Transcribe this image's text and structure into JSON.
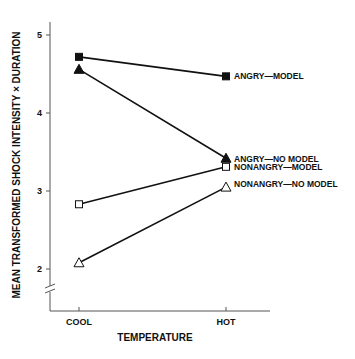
{
  "chart_data": {
    "type": "line",
    "title": "",
    "xlabel": "TEMPERATURE",
    "ylabel": "MEAN TRANSFORMED SHOCK INTENSITY × DURATION",
    "categories": [
      "COOL",
      "HOT"
    ],
    "y_ticks": [
      2,
      3,
      4,
      5
    ],
    "ylim": [
      1.5,
      5.3
    ],
    "axis_break": true,
    "grid": false,
    "legend_position": "inline-right",
    "series": [
      {
        "name": "ANGRY—MODEL",
        "marker": "filled-square",
        "values": [
          4.72,
          4.47
        ]
      },
      {
        "name": "ANGRY—NO MODEL",
        "marker": "filled-triangle",
        "values": [
          4.56,
          3.42
        ]
      },
      {
        "name": "NONANGRY—MODEL",
        "marker": "open-square",
        "values": [
          2.83,
          3.31
        ]
      },
      {
        "name": "NONANGRY—NO MODEL",
        "marker": "open-triangle",
        "values": [
          2.08,
          3.05
        ]
      }
    ]
  },
  "colors": {
    "line": "#111111",
    "axis": "#555555",
    "background": "#ffffff"
  }
}
